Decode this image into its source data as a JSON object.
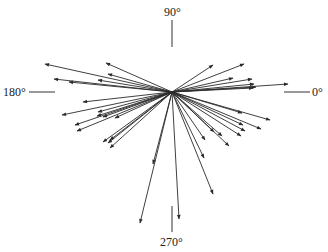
{
  "diagram": {
    "type": "vector-rose",
    "center": [
      172,
      92
    ],
    "color": "#2a2a2a",
    "axis_labels": {
      "deg0": "0°",
      "deg90": "90°",
      "deg180": "180°",
      "deg270": "270°"
    },
    "arrow_endpoints": [
      [
        45,
        64
      ],
      [
        106,
        63
      ],
      [
        54,
        79
      ],
      [
        69,
        82
      ],
      [
        108,
        74
      ],
      [
        98,
        80
      ],
      [
        213,
        65
      ],
      [
        244,
        64
      ],
      [
        233,
        78
      ],
      [
        252,
        79
      ],
      [
        254,
        84
      ],
      [
        256,
        87
      ],
      [
        253,
        88
      ],
      [
        288,
        84
      ],
      [
        83,
        102
      ],
      [
        62,
        115
      ],
      [
        75,
        125
      ],
      [
        98,
        112
      ],
      [
        97,
        116
      ],
      [
        103,
        117
      ],
      [
        77,
        131
      ],
      [
        115,
        118
      ],
      [
        270,
        120
      ],
      [
        242,
        113
      ],
      [
        243,
        125
      ],
      [
        261,
        129
      ],
      [
        245,
        131
      ],
      [
        241,
        136
      ],
      [
        214,
        132
      ],
      [
        222,
        136
      ],
      [
        205,
        140
      ],
      [
        229,
        146
      ],
      [
        103,
        142
      ],
      [
        110,
        148
      ],
      [
        108,
        143
      ],
      [
        110,
        140
      ],
      [
        153,
        164
      ],
      [
        140,
        223
      ],
      [
        179,
        219
      ],
      [
        213,
        194
      ],
      [
        204,
        158
      ]
    ]
  }
}
